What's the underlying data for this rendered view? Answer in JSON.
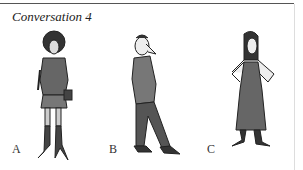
{
  "page": {
    "title": "Conversation 4",
    "figures": [
      {
        "label": "A",
        "description": "woman with curly hair, short-sleeve top, short skirt, shoulder bag, tall boots"
      },
      {
        "label": "B",
        "description": "man with large nose, polo shirt, trousers, hands in pockets"
      },
      {
        "label": "C",
        "description": "woman with long straight hair, long sleeveless dress, hands on hips"
      }
    ]
  }
}
